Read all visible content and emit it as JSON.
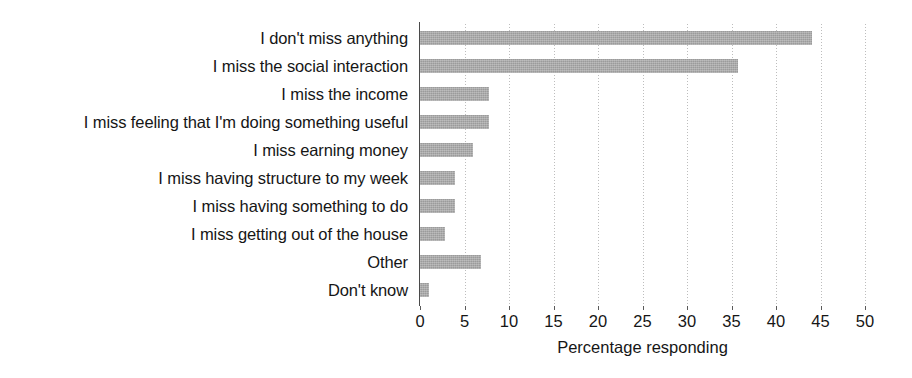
{
  "chart_data": {
    "type": "bar",
    "orientation": "horizontal",
    "title": "",
    "xlabel": "Percentage responding",
    "ylabel": "",
    "xlim": [
      0,
      50
    ],
    "xticks": [
      0,
      5,
      10,
      15,
      20,
      25,
      30,
      35,
      40,
      45,
      50
    ],
    "grid": true,
    "legend": false,
    "bar_color": "#aaaaaa",
    "axis_color": "#4a4a4a",
    "categories": [
      "I don't miss anything",
      "I miss the social interaction",
      "I miss the income",
      "I miss feeling that I'm doing something useful",
      "I miss earning money",
      "I miss having structure to my week",
      "I miss having something to do",
      "I miss getting out of the house",
      "Other",
      "Don't know"
    ],
    "values": [
      44,
      35.7,
      7.7,
      7.7,
      6,
      3.9,
      3.9,
      2.8,
      6.8,
      1
    ]
  }
}
